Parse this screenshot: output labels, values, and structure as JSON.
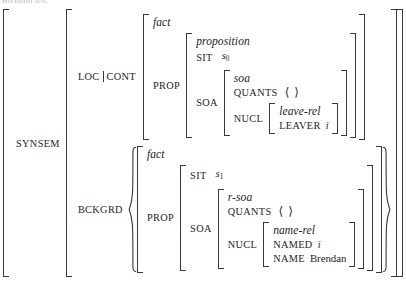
{
  "document": {
    "kind": "hpsg-avm-feature-structure",
    "cropped_caption": "Brendan left."
  },
  "structure": {
    "root_attribute": "SYNSEM",
    "branches": [
      {
        "attribute": "LOC|CONT",
        "attribute_left": "LOC",
        "attribute_right": "CONT",
        "separator": "|",
        "value": {
          "type": "fact",
          "rows": [
            {
              "attribute": "PROP",
              "value": {
                "type": "proposition",
                "rows": [
                  {
                    "attribute": "SIT",
                    "value": "s",
                    "subscript": "0"
                  },
                  {
                    "attribute": "SOA",
                    "value": {
                      "type": "soa",
                      "rows": [
                        {
                          "attribute": "QUANTS",
                          "value": "⟨ ⟩"
                        },
                        {
                          "attribute": "NUCL",
                          "value": {
                            "type": "leave-rel",
                            "rows": [
                              {
                                "attribute": "LEAVER",
                                "value": "i"
                              }
                            ]
                          }
                        }
                      ]
                    }
                  }
                ]
              }
            }
          ]
        }
      },
      {
        "attribute": "BCKGRD",
        "is_set": true,
        "value": {
          "type": "fact",
          "rows": [
            {
              "attribute": "PROP",
              "value": {
                "type": "",
                "rows": [
                  {
                    "attribute": "SIT",
                    "value": "s",
                    "subscript": "1"
                  },
                  {
                    "attribute": "SOA",
                    "value": {
                      "type": "r-soa",
                      "rows": [
                        {
                          "attribute": "QUANTS",
                          "value": "⟨ ⟩"
                        },
                        {
                          "attribute": "NUCL",
                          "value": {
                            "type": "name-rel",
                            "rows": [
                              {
                                "attribute": "NAMED",
                                "value": "i"
                              },
                              {
                                "attribute": "NAME",
                                "value": "Brendan"
                              }
                            ]
                          }
                        }
                      ]
                    }
                  }
                ]
              }
            }
          ]
        }
      }
    ]
  },
  "labels": {
    "synsem": "SYNSEM",
    "loc": "LOC",
    "cont": "CONT",
    "bckgrd": "BCKGRD",
    "prop": "PROP",
    "sit": "SIT",
    "soa": "SOA",
    "quants": "QUANTS",
    "nucl": "NUCL",
    "leaver": "LEAVER",
    "named": "NAMED",
    "name": "NAME"
  },
  "types": {
    "fact": "fact",
    "proposition": "proposition",
    "soa": "soa",
    "leave_rel": "leave-rel",
    "r_soa": "r-soa",
    "name_rel": "name-rel"
  },
  "values": {
    "s0_base": "s",
    "s0_sub": "0",
    "s1_base": "s",
    "s1_sub": "1",
    "empty_list": "⟨ ⟩",
    "index_i": "i",
    "index_i2": "i",
    "brendan": "Brendan"
  },
  "colors": {
    "ink": "#1d1d1d",
    "rule": "#38383c",
    "paper": "#ffffff",
    "faint": "#b9b9b9"
  }
}
